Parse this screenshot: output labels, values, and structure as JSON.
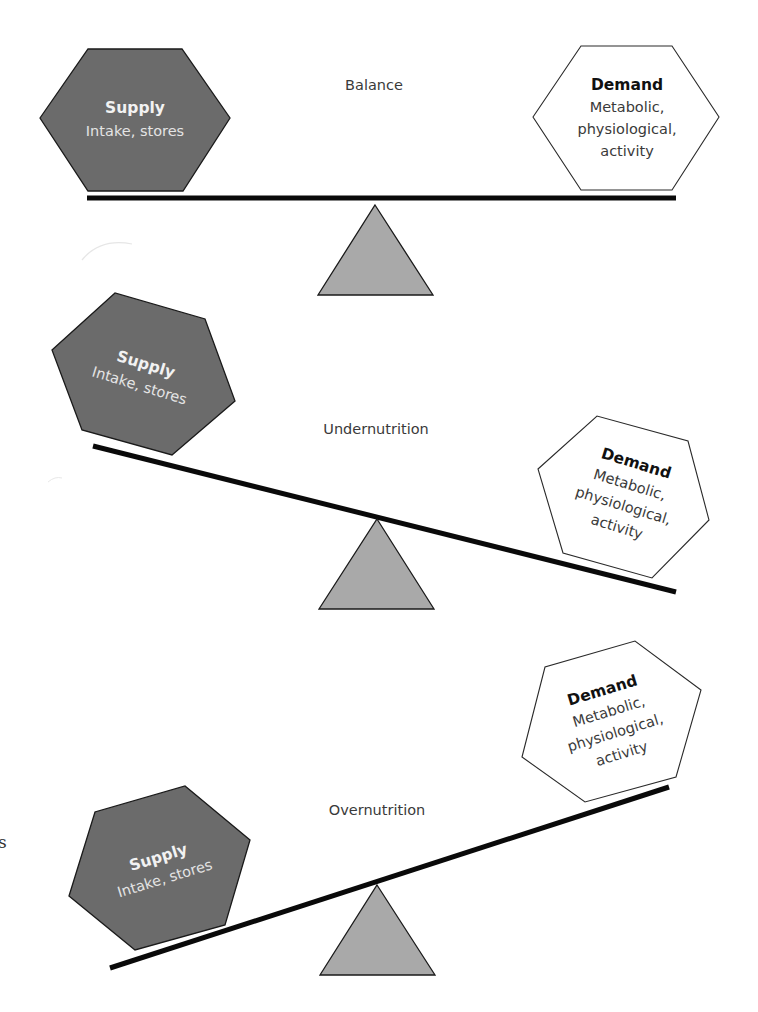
{
  "diagram": {
    "type": "seesaw-balance-diagram",
    "panels": [
      {
        "id": "balance",
        "title": "Balance",
        "tilt": "level",
        "supply": {
          "title": "Supply",
          "lines": [
            "Intake, stores"
          ]
        },
        "demand": {
          "title": "Demand",
          "lines": [
            "Metabolic,",
            "physiological,",
            "activity"
          ]
        }
      },
      {
        "id": "undernutrition",
        "title": "Undernutrition",
        "tilt": "demand-side-down",
        "supply": {
          "title": "Supply",
          "lines": [
            "Intake, stores"
          ]
        },
        "demand": {
          "title": "Demand",
          "lines": [
            "Metabolic,",
            "physiological,",
            "activity"
          ]
        }
      },
      {
        "id": "overnutrition",
        "title": "Overnutrition",
        "tilt": "supply-side-down",
        "supply": {
          "title": "Supply",
          "lines": [
            "Intake, stores"
          ]
        },
        "demand": {
          "title": "Demand",
          "lines": [
            "Metabolic,",
            "physiological,",
            "activity"
          ]
        }
      }
    ],
    "edge_fragment": "s"
  },
  "colors": {
    "supply_fill": "#6b6b6b",
    "demand_fill": "#ffffff",
    "fulcrum_fill": "#a9a9a9",
    "beam": "#0a0a0a",
    "outline": "#1a1a1a",
    "label_text": "#3a3a3a"
  }
}
